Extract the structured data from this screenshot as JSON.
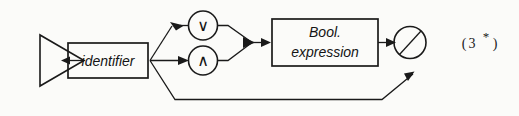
{
  "diagram": {
    "type": "syntax-railroad-diagram",
    "background_color": "#fbfbf9",
    "ink_color": "#1a1a1a",
    "start_symbol": {
      "name": "start-triangle",
      "shape": "triangle-right"
    },
    "nodes": [
      {
        "id": "identifier",
        "kind": "nonterminal-box",
        "label": "identifier"
      },
      {
        "id": "or-operator",
        "kind": "terminal-circle",
        "label": "∨"
      },
      {
        "id": "and-operator",
        "kind": "terminal-circle",
        "label": "∧"
      },
      {
        "id": "bool-expression",
        "kind": "nonterminal-box",
        "label_line1": "Bool.",
        "label_line2": "expression"
      },
      {
        "id": "exit-node",
        "kind": "slashed-circle",
        "label": ""
      }
    ],
    "annotation": {
      "full": "(3 *)",
      "open_paren": "(",
      "number": "3",
      "star": "*",
      "close_paren": ")"
    }
  }
}
